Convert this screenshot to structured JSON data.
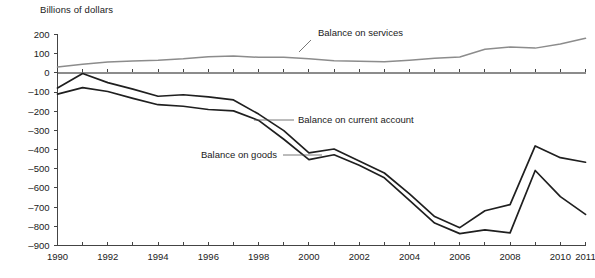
{
  "chart_data": {
    "type": "line",
    "title": "",
    "ylabel": "Billions of dollars",
    "xlabel": "",
    "ylim": [
      -900,
      200
    ],
    "ytick_step": 100,
    "yticks": [
      200,
      100,
      0,
      -100,
      -200,
      -300,
      -400,
      -500,
      -600,
      -700,
      -800,
      -900
    ],
    "ytick_labels": [
      "200",
      "100",
      "0",
      "–100",
      "–200",
      "–300",
      "–400",
      "–500",
      "–600",
      "–700",
      "–800",
      "–900"
    ],
    "xlim": [
      1990,
      2011
    ],
    "x": [
      1990,
      1991,
      1992,
      1993,
      1994,
      1995,
      1996,
      1997,
      1998,
      1999,
      2000,
      2001,
      2002,
      2003,
      2004,
      2005,
      2006,
      2007,
      2008,
      2009,
      2010,
      2011
    ],
    "xticks": [
      1990,
      1991,
      1992,
      1993,
      1994,
      1995,
      1996,
      1997,
      1998,
      1999,
      2000,
      2001,
      2002,
      2003,
      2004,
      2005,
      2006,
      2007,
      2008,
      2009,
      2010,
      2011
    ],
    "xtick_labels_shown": [
      "1990",
      "1992",
      "1994",
      "1996",
      "1998",
      "2000",
      "2002",
      "2004",
      "2006",
      "2008",
      "2010",
      "2011"
    ],
    "grid": false,
    "legend": "annotations-on-lines",
    "series": [
      {
        "name": "Balance on services",
        "color": "#8c8c8c",
        "values": [
          30,
          45,
          57,
          62,
          66,
          73,
          84,
          88,
          81,
          81,
          74,
          63,
          60,
          58,
          66,
          76,
          83,
          123,
          135,
          129,
          150,
          180
        ]
      },
      {
        "name": "Balance on current account",
        "color": "#1f1f1f",
        "values": [
          -79,
          -3,
          -51,
          -85,
          -122,
          -114,
          -125,
          -141,
          -215,
          -301,
          -417,
          -397,
          -459,
          -522,
          -631,
          -749,
          -807,
          -719,
          -687,
          -381,
          -442,
          -466
        ]
      },
      {
        "name": "Balance on goods",
        "color": "#1f1f1f",
        "values": [
          -111,
          -77,
          -97,
          -133,
          -166,
          -174,
          -191,
          -198,
          -248,
          -346,
          -452,
          -427,
          -482,
          -547,
          -665,
          -783,
          -838,
          -819,
          -834,
          -509,
          -645,
          -738
        ]
      }
    ],
    "annotations": [
      {
        "text": "Balance on services",
        "target_year": 2000,
        "target_value": 74
      },
      {
        "text": "Balance on current account",
        "target_year": 1999,
        "target_value": -301
      },
      {
        "text": "Balance on goods",
        "target_year": 2001,
        "target_value": -427
      }
    ]
  }
}
